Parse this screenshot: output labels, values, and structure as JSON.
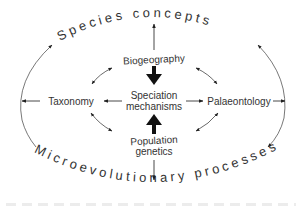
{
  "diagram": {
    "outer_top": "Species concepts",
    "outer_bottom": "Microevolutionary processes",
    "center": {
      "line1": "Speciation",
      "line2": "mechanisms"
    },
    "nodes": {
      "top": "Biogeography",
      "left": "Taxonomy",
      "right": "Palaeontology",
      "bottom_line1": "Population",
      "bottom_line2": "genetics"
    },
    "colors": {
      "text": "#333333",
      "line": "#555555",
      "bold_arrow": "#111111",
      "background": "#ffffff"
    }
  }
}
